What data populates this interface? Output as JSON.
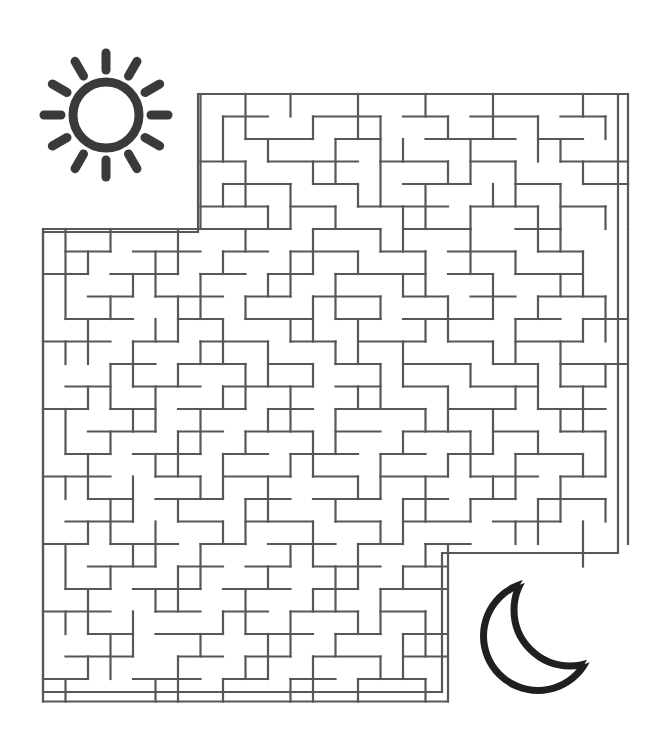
{
  "page": {
    "kind": "maze-puzzle-worksheet",
    "width": 660,
    "height": 752,
    "background_color": "#ffffff"
  },
  "colors": {
    "maze_wall": "#575757",
    "sun": "#3a3a3a",
    "moon": "#1f1f1f",
    "paper": "#ffffff"
  },
  "icons": {
    "sun": {
      "name": "sun-icon",
      "role": "maze-start-marker",
      "center_x": 106,
      "center_y": 115,
      "radius": 33,
      "stroke_width": 9,
      "ray_count": 12,
      "ray_inner_radius": 45,
      "ray_outer_radius": 62,
      "ray_stroke_width": 9,
      "color": "#3a3a3a"
    },
    "moon": {
      "name": "moon-icon",
      "role": "maze-finish-marker",
      "center_x": 538,
      "center_y": 636,
      "radius": 58,
      "cut_offset_x": 32,
      "cut_offset_y": -26,
      "cut_radius": 56,
      "stroke_width": 7,
      "color": "#1f1f1f"
    }
  },
  "maze": {
    "name": "maze-grid",
    "cell": 22.5,
    "stroke_width": 2.2,
    "origin_x": 43,
    "origin_y": 94,
    "cols": 26,
    "rows": 27,
    "upper_block": {
      "col_start": 7,
      "col_end": 26,
      "row_start": 0,
      "row_end": 6
    },
    "left_block": {
      "col_start": 0,
      "col_end": 26,
      "row_start": 6,
      "row_end": 27
    },
    "right_cutout": {
      "col_start": 18,
      "row_start": 20
    },
    "entrance": {
      "description": "top-left opening above sun side",
      "col": 0,
      "row": 6
    },
    "exit": {
      "description": "bottom-right opening toward moon",
      "col": 18,
      "row": 20
    },
    "outline": "M 198 94 L 618 94 L 618 553 L 442 553 L 442 692 L 43 692 L 43 232 L 198 232 Z",
    "walls_h": [
      [
        7,
        0,
        19
      ],
      [
        0,
        6,
        7
      ],
      [
        7,
        6,
        4
      ],
      [
        12,
        6,
        3
      ],
      [
        16,
        6,
        3
      ],
      [
        21,
        6,
        2
      ],
      [
        0,
        27,
        18
      ],
      [
        8,
        1,
        2
      ],
      [
        12,
        1,
        3
      ],
      [
        16,
        1,
        2
      ],
      [
        19,
        1,
        3
      ],
      [
        23,
        1,
        2
      ],
      [
        9,
        2,
        3
      ],
      [
        13,
        2,
        2
      ],
      [
        17,
        2,
        4
      ],
      [
        22,
        2,
        2
      ],
      [
        7,
        3,
        2
      ],
      [
        10,
        3,
        4
      ],
      [
        15,
        3,
        3
      ],
      [
        19,
        3,
        2
      ],
      [
        23,
        3,
        3
      ],
      [
        8,
        4,
        3
      ],
      [
        12,
        4,
        2
      ],
      [
        16,
        4,
        3
      ],
      [
        21,
        4,
        2
      ],
      [
        24,
        4,
        2
      ],
      [
        7,
        5,
        3
      ],
      [
        11,
        5,
        2
      ],
      [
        14,
        5,
        4
      ],
      [
        19,
        5,
        3
      ],
      [
        23,
        5,
        2
      ],
      [
        1,
        7,
        2
      ],
      [
        4,
        7,
        3
      ],
      [
        8,
        7,
        2
      ],
      [
        11,
        7,
        3
      ],
      [
        15,
        7,
        2
      ],
      [
        18,
        7,
        3
      ],
      [
        22,
        7,
        2
      ],
      [
        0,
        8,
        2
      ],
      [
        3,
        8,
        3
      ],
      [
        7,
        8,
        2
      ],
      [
        10,
        8,
        2
      ],
      [
        13,
        8,
        4
      ],
      [
        18,
        8,
        2
      ],
      [
        21,
        8,
        3
      ],
      [
        2,
        9,
        2
      ],
      [
        5,
        9,
        3
      ],
      [
        9,
        9,
        2
      ],
      [
        12,
        9,
        3
      ],
      [
        16,
        9,
        2
      ],
      [
        19,
        9,
        2
      ],
      [
        22,
        9,
        3
      ],
      [
        1,
        10,
        3
      ],
      [
        6,
        10,
        2
      ],
      [
        9,
        10,
        3
      ],
      [
        13,
        10,
        2
      ],
      [
        16,
        10,
        4
      ],
      [
        21,
        10,
        2
      ],
      [
        24,
        10,
        2
      ],
      [
        0,
        11,
        3
      ],
      [
        4,
        11,
        2
      ],
      [
        7,
        11,
        3
      ],
      [
        11,
        11,
        2
      ],
      [
        14,
        11,
        3
      ],
      [
        18,
        11,
        2
      ],
      [
        21,
        11,
        3
      ],
      [
        3,
        12,
        2
      ],
      [
        6,
        12,
        3
      ],
      [
        10,
        12,
        2
      ],
      [
        13,
        12,
        2
      ],
      [
        16,
        12,
        3
      ],
      [
        20,
        12,
        2
      ],
      [
        23,
        12,
        3
      ],
      [
        1,
        13,
        2
      ],
      [
        4,
        13,
        3
      ],
      [
        8,
        13,
        4
      ],
      [
        13,
        13,
        2
      ],
      [
        16,
        13,
        2
      ],
      [
        19,
        13,
        3
      ],
      [
        23,
        13,
        2
      ],
      [
        0,
        14,
        2
      ],
      [
        3,
        14,
        2
      ],
      [
        6,
        14,
        3
      ],
      [
        10,
        14,
        2
      ],
      [
        13,
        14,
        4
      ],
      [
        18,
        14,
        3
      ],
      [
        22,
        14,
        3
      ],
      [
        2,
        15,
        3
      ],
      [
        6,
        15,
        2
      ],
      [
        9,
        15,
        3
      ],
      [
        13,
        15,
        2
      ],
      [
        16,
        15,
        3
      ],
      [
        20,
        15,
        2
      ],
      [
        23,
        15,
        2
      ],
      [
        1,
        16,
        2
      ],
      [
        4,
        16,
        3
      ],
      [
        8,
        16,
        2
      ],
      [
        11,
        16,
        3
      ],
      [
        15,
        16,
        2
      ],
      [
        18,
        16,
        2
      ],
      [
        21,
        16,
        3
      ],
      [
        0,
        17,
        3
      ],
      [
        5,
        17,
        2
      ],
      [
        8,
        17,
        3
      ],
      [
        12,
        17,
        2
      ],
      [
        15,
        17,
        3
      ],
      [
        19,
        17,
        3
      ],
      [
        23,
        17,
        2
      ],
      [
        2,
        18,
        2
      ],
      [
        5,
        18,
        3
      ],
      [
        9,
        18,
        2
      ],
      [
        12,
        18,
        3
      ],
      [
        16,
        18,
        2
      ],
      [
        19,
        18,
        2
      ],
      [
        22,
        18,
        3
      ],
      [
        1,
        19,
        3
      ],
      [
        6,
        19,
        2
      ],
      [
        9,
        19,
        3
      ],
      [
        13,
        19,
        2
      ],
      [
        16,
        19,
        3
      ],
      [
        20,
        19,
        3
      ],
      [
        0,
        20,
        2
      ],
      [
        3,
        20,
        3
      ],
      [
        7,
        20,
        2
      ],
      [
        10,
        20,
        3
      ],
      [
        14,
        20,
        2
      ],
      [
        17,
        20,
        2
      ],
      [
        2,
        21,
        3
      ],
      [
        6,
        21,
        2
      ],
      [
        9,
        21,
        2
      ],
      [
        12,
        21,
        3
      ],
      [
        16,
        21,
        2
      ],
      [
        1,
        22,
        2
      ],
      [
        4,
        22,
        3
      ],
      [
        8,
        22,
        3
      ],
      [
        12,
        22,
        2
      ],
      [
        15,
        22,
        3
      ],
      [
        0,
        23,
        3
      ],
      [
        5,
        23,
        2
      ],
      [
        8,
        23,
        2
      ],
      [
        11,
        23,
        3
      ],
      [
        15,
        23,
        2
      ],
      [
        2,
        24,
        2
      ],
      [
        5,
        24,
        3
      ],
      [
        9,
        24,
        3
      ],
      [
        13,
        24,
        2
      ],
      [
        16,
        24,
        2
      ],
      [
        1,
        25,
        3
      ],
      [
        6,
        25,
        2
      ],
      [
        9,
        25,
        2
      ],
      [
        12,
        25,
        3
      ],
      [
        16,
        25,
        2
      ],
      [
        0,
        26,
        2
      ],
      [
        4,
        26,
        3
      ],
      [
        8,
        26,
        2
      ],
      [
        11,
        26,
        2
      ],
      [
        14,
        26,
        3
      ]
    ],
    "walls_v": [
      [
        7,
        0,
        6
      ],
      [
        26,
        0,
        6
      ],
      [
        0,
        6,
        21
      ],
      [
        26,
        6,
        14
      ],
      [
        18,
        20,
        7
      ],
      [
        9,
        0,
        2
      ],
      [
        11,
        0,
        1
      ],
      [
        14,
        0,
        2
      ],
      [
        17,
        0,
        1
      ],
      [
        20,
        0,
        2
      ],
      [
        24,
        0,
        1
      ],
      [
        8,
        1,
        2
      ],
      [
        12,
        1,
        1
      ],
      [
        15,
        1,
        2
      ],
      [
        18,
        1,
        1
      ],
      [
        22,
        1,
        2
      ],
      [
        25,
        1,
        1
      ],
      [
        10,
        2,
        1
      ],
      [
        13,
        2,
        2
      ],
      [
        16,
        2,
        1
      ],
      [
        19,
        2,
        2
      ],
      [
        23,
        2,
        1
      ],
      [
        9,
        3,
        2
      ],
      [
        12,
        3,
        1
      ],
      [
        15,
        3,
        2
      ],
      [
        18,
        3,
        1
      ],
      [
        21,
        3,
        2
      ],
      [
        24,
        3,
        1
      ],
      [
        8,
        4,
        1
      ],
      [
        11,
        4,
        2
      ],
      [
        14,
        4,
        1
      ],
      [
        17,
        4,
        2
      ],
      [
        20,
        4,
        1
      ],
      [
        23,
        4,
        2
      ],
      [
        10,
        5,
        1
      ],
      [
        13,
        5,
        1
      ],
      [
        16,
        5,
        2
      ],
      [
        19,
        5,
        1
      ],
      [
        22,
        5,
        2
      ],
      [
        25,
        5,
        1
      ],
      [
        1,
        6,
        2
      ],
      [
        3,
        6,
        1
      ],
      [
        6,
        6,
        2
      ],
      [
        9,
        6,
        1
      ],
      [
        12,
        6,
        2
      ],
      [
        15,
        6,
        1
      ],
      [
        19,
        6,
        2
      ],
      [
        23,
        6,
        1
      ],
      [
        2,
        7,
        1
      ],
      [
        5,
        7,
        2
      ],
      [
        8,
        7,
        1
      ],
      [
        11,
        7,
        2
      ],
      [
        14,
        7,
        1
      ],
      [
        17,
        7,
        2
      ],
      [
        21,
        7,
        1
      ],
      [
        24,
        7,
        2
      ],
      [
        1,
        8,
        2
      ],
      [
        4,
        8,
        1
      ],
      [
        7,
        8,
        2
      ],
      [
        10,
        8,
        1
      ],
      [
        13,
        8,
        2
      ],
      [
        16,
        8,
        1
      ],
      [
        20,
        8,
        2
      ],
      [
        23,
        8,
        1
      ],
      [
        3,
        9,
        1
      ],
      [
        6,
        9,
        2
      ],
      [
        9,
        9,
        1
      ],
      [
        12,
        9,
        2
      ],
      [
        15,
        9,
        1
      ],
      [
        18,
        9,
        2
      ],
      [
        22,
        9,
        1
      ],
      [
        25,
        9,
        2
      ],
      [
        2,
        10,
        2
      ],
      [
        5,
        10,
        1
      ],
      [
        8,
        10,
        2
      ],
      [
        11,
        10,
        1
      ],
      [
        14,
        10,
        2
      ],
      [
        17,
        10,
        1
      ],
      [
        21,
        10,
        2
      ],
      [
        24,
        10,
        1
      ],
      [
        1,
        11,
        1
      ],
      [
        4,
        11,
        2
      ],
      [
        7,
        11,
        1
      ],
      [
        10,
        11,
        2
      ],
      [
        13,
        11,
        1
      ],
      [
        16,
        11,
        2
      ],
      [
        20,
        11,
        1
      ],
      [
        23,
        11,
        2
      ],
      [
        3,
        12,
        2
      ],
      [
        6,
        12,
        1
      ],
      [
        9,
        12,
        2
      ],
      [
        12,
        12,
        1
      ],
      [
        15,
        12,
        2
      ],
      [
        19,
        12,
        1
      ],
      [
        22,
        12,
        2
      ],
      [
        25,
        12,
        1
      ],
      [
        2,
        13,
        1
      ],
      [
        5,
        13,
        2
      ],
      [
        8,
        13,
        1
      ],
      [
        11,
        13,
        2
      ],
      [
        14,
        13,
        1
      ],
      [
        18,
        13,
        2
      ],
      [
        21,
        13,
        1
      ],
      [
        24,
        13,
        2
      ],
      [
        1,
        14,
        2
      ],
      [
        4,
        14,
        1
      ],
      [
        7,
        14,
        2
      ],
      [
        10,
        14,
        1
      ],
      [
        13,
        14,
        2
      ],
      [
        17,
        14,
        1
      ],
      [
        20,
        14,
        2
      ],
      [
        23,
        14,
        1
      ],
      [
        3,
        15,
        1
      ],
      [
        6,
        15,
        2
      ],
      [
        9,
        15,
        1
      ],
      [
        12,
        15,
        2
      ],
      [
        16,
        15,
        1
      ],
      [
        19,
        15,
        2
      ],
      [
        22,
        15,
        1
      ],
      [
        25,
        15,
        2
      ],
      [
        2,
        16,
        2
      ],
      [
        5,
        16,
        1
      ],
      [
        8,
        16,
        2
      ],
      [
        11,
        16,
        1
      ],
      [
        15,
        16,
        2
      ],
      [
        18,
        16,
        1
      ],
      [
        21,
        16,
        2
      ],
      [
        24,
        16,
        1
      ],
      [
        1,
        17,
        1
      ],
      [
        4,
        17,
        2
      ],
      [
        7,
        17,
        1
      ],
      [
        10,
        17,
        2
      ],
      [
        14,
        17,
        1
      ],
      [
        17,
        17,
        2
      ],
      [
        20,
        17,
        1
      ],
      [
        23,
        17,
        2
      ],
      [
        3,
        18,
        2
      ],
      [
        6,
        18,
        1
      ],
      [
        9,
        18,
        2
      ],
      [
        13,
        18,
        1
      ],
      [
        16,
        18,
        2
      ],
      [
        19,
        18,
        1
      ],
      [
        22,
        18,
        2
      ],
      [
        25,
        18,
        1
      ],
      [
        2,
        19,
        1
      ],
      [
        5,
        19,
        2
      ],
      [
        8,
        19,
        1
      ],
      [
        12,
        19,
        2
      ],
      [
        15,
        19,
        1
      ],
      [
        21,
        19,
        1
      ],
      [
        24,
        19,
        2
      ],
      [
        1,
        20,
        2
      ],
      [
        4,
        20,
        1
      ],
      [
        7,
        20,
        2
      ],
      [
        11,
        20,
        1
      ],
      [
        14,
        20,
        2
      ],
      [
        17,
        20,
        1
      ],
      [
        3,
        21,
        1
      ],
      [
        6,
        21,
        2
      ],
      [
        10,
        21,
        1
      ],
      [
        13,
        21,
        2
      ],
      [
        16,
        21,
        1
      ],
      [
        2,
        22,
        2
      ],
      [
        5,
        22,
        1
      ],
      [
        9,
        22,
        2
      ],
      [
        12,
        22,
        1
      ],
      [
        15,
        22,
        2
      ],
      [
        1,
        23,
        1
      ],
      [
        4,
        23,
        2
      ],
      [
        8,
        23,
        1
      ],
      [
        11,
        23,
        2
      ],
      [
        14,
        23,
        1
      ],
      [
        17,
        23,
        2
      ],
      [
        3,
        24,
        2
      ],
      [
        7,
        24,
        1
      ],
      [
        10,
        24,
        2
      ],
      [
        13,
        24,
        1
      ],
      [
        16,
        24,
        2
      ],
      [
        2,
        25,
        1
      ],
      [
        6,
        25,
        2
      ],
      [
        9,
        25,
        1
      ],
      [
        12,
        25,
        2
      ],
      [
        15,
        25,
        1
      ],
      [
        1,
        26,
        1
      ],
      [
        5,
        26,
        1
      ],
      [
        8,
        26,
        1
      ],
      [
        11,
        26,
        1
      ],
      [
        14,
        26,
        1
      ],
      [
        17,
        26,
        1
      ]
    ]
  }
}
